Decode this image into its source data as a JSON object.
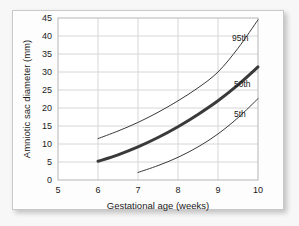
{
  "chart_data": {
    "type": "line",
    "title": "",
    "subtitle": "",
    "xlabel": "Gestational age (weeks)",
    "ylabel": "Amniotic sac diameter (mm)",
    "xlim": [
      5,
      10
    ],
    "ylim": [
      0,
      45
    ],
    "xticks": [
      5,
      6,
      7,
      8,
      9,
      10
    ],
    "yticks": [
      0,
      5,
      10,
      15,
      20,
      25,
      30,
      35,
      40,
      45
    ],
    "xtick_labels": [
      "5",
      "6",
      "7",
      "8",
      "9",
      "10"
    ],
    "ytick_labels": [
      "0",
      "5",
      "10",
      "15",
      "20",
      "25",
      "30",
      "35",
      "40",
      "45"
    ],
    "grid": true,
    "grid_color": "#d6d6d6",
    "legend_position": "inline-right",
    "line_color": "#3a3a3a",
    "series": [
      {
        "name": "95th",
        "label": "95th",
        "emphasis": false,
        "line_width": 1,
        "x": [
          6,
          6.5,
          7,
          7.5,
          8,
          8.5,
          9,
          9.5,
          10
        ],
        "values": [
          11.5,
          13.6,
          16.0,
          18.8,
          22.0,
          25.6,
          30.0,
          36.6,
          44.5
        ]
      },
      {
        "name": "50th",
        "label": "50th",
        "emphasis": true,
        "line_width": 3,
        "x": [
          6,
          6.5,
          7,
          7.5,
          8,
          8.5,
          9,
          9.5,
          10
        ],
        "values": [
          5.2,
          7.0,
          9.2,
          11.8,
          14.8,
          18.2,
          22.0,
          26.4,
          31.4
        ]
      },
      {
        "name": "5th",
        "label": "5th",
        "emphasis": false,
        "line_width": 1,
        "x": [
          7,
          7.5,
          8,
          8.5,
          9,
          9.5,
          10
        ],
        "values": [
          2.1,
          4.0,
          6.3,
          9.2,
          12.8,
          17.3,
          22.6
        ]
      }
    ],
    "annotations": [
      {
        "text": "95th",
        "x": 9.35,
        "y": 38.6
      },
      {
        "text": "50th",
        "x": 9.4,
        "y": 25.8
      },
      {
        "text": "5th",
        "x": 9.4,
        "y": 17.5
      }
    ]
  }
}
